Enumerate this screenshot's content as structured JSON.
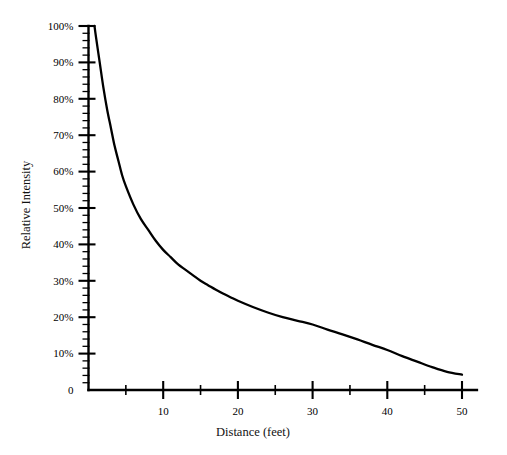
{
  "chart_data": {
    "type": "line",
    "title": "",
    "subtitle": "",
    "xlabel": "Distance (feet)",
    "ylabel": "Relative Intensity",
    "xlim": [
      0,
      52
    ],
    "ylim": [
      0,
      100
    ],
    "grid": false,
    "legend": null,
    "x_major_ticks": [
      10,
      20,
      30,
      40,
      50
    ],
    "x_major_tick_labels": [
      "10",
      "20",
      "30",
      "40",
      "50"
    ],
    "x_minor_ticks": [
      5,
      15,
      25,
      35,
      45
    ],
    "y_major_ticks": [
      0,
      10,
      20,
      30,
      40,
      50,
      60,
      70,
      80,
      90,
      100
    ],
    "y_major_tick_labels": [
      "0",
      "10%",
      "20%",
      "30%",
      "40%",
      "50%",
      "60%",
      "70%",
      "80%",
      "90%",
      "100%"
    ],
    "y_minor_tick_step": 2,
    "series": [
      {
        "name": "Relative Intensity",
        "x": [
          0.8,
          1,
          1.5,
          2,
          2.5,
          3,
          3.5,
          4,
          4.5,
          5,
          6,
          7,
          8,
          9,
          10,
          11,
          12,
          13,
          14,
          15,
          16,
          17,
          18,
          19,
          20,
          22,
          24,
          26,
          28,
          30,
          32,
          34,
          36,
          38,
          40,
          42,
          44,
          46,
          48,
          50
        ],
        "values": [
          100,
          97,
          90,
          83,
          77,
          72,
          67,
          63,
          59,
          56,
          51,
          47,
          44,
          41,
          38.5,
          36.5,
          34.5,
          33,
          31.5,
          30,
          28.8,
          27.6,
          26.5,
          25.5,
          24.5,
          22.8,
          21.3,
          20,
          19,
          18,
          16.6,
          15.3,
          13.9,
          12.4,
          11,
          9.3,
          7.8,
          6.3,
          5,
          4.2
        ]
      }
    ],
    "annotations": []
  }
}
